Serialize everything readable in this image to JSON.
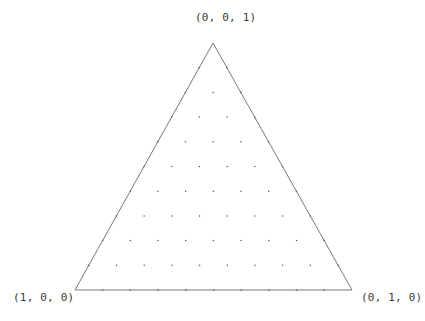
{
  "diagram": {
    "type": "ternary-simplex-lattice",
    "divisions": 10,
    "vertices": {
      "top": {
        "label": "(0, 0, 1)",
        "coords": [
          0,
          0,
          1
        ]
      },
      "left": {
        "label": "(1, 0, 0)",
        "coords": [
          1,
          0,
          0
        ]
      },
      "right": {
        "label": "(0, 1, 0)",
        "coords": [
          0,
          1,
          0
        ]
      }
    },
    "colors": {
      "edge": "#6a6a6a",
      "point": "#555555",
      "label": "#3a3a3a",
      "background": "#ffffff"
    }
  }
}
